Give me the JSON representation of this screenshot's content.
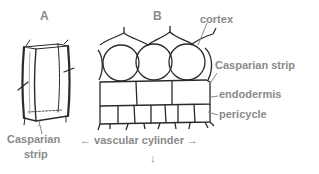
{
  "diagram": {
    "panels": [
      {
        "id": "A",
        "label": "A"
      },
      {
        "id": "B",
        "label": "B"
      }
    ],
    "panel_a": {
      "label_line1": "Casparian",
      "label_line2": "strip"
    },
    "panel_b": {
      "labels": {
        "cortex": "cortex",
        "casparian_strip": "Casparian strip",
        "endodermis": "endodermis",
        "pericycle": "pericycle"
      },
      "bottom_label": "vascular cylinder",
      "left_arrow": "←",
      "right_arrow": "→",
      "down_arrow": "↓"
    },
    "colors": {
      "label_text": "#8a8a8a",
      "line": "#2a2a2a",
      "leader": "#8a8a8a"
    }
  }
}
